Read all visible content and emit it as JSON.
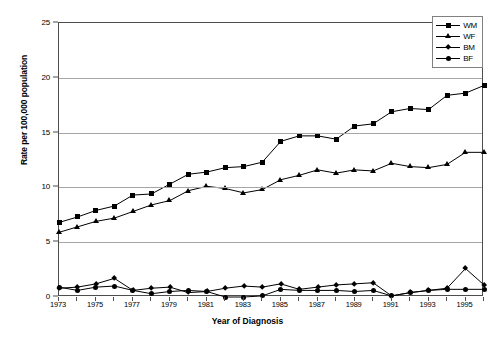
{
  "chart_data": {
    "type": "line",
    "title": "",
    "xlabel": "Year of Diagnosis",
    "ylabel": "Rate per 100,000 population",
    "xlim": [
      1973,
      1996
    ],
    "ylim": [
      0,
      25
    ],
    "ytick_values": [
      0,
      5,
      10,
      15,
      20,
      25
    ],
    "ytick_labels": [
      "0",
      "5",
      "10",
      "15",
      "20",
      "25"
    ],
    "xtick_values": [
      1973,
      1975,
      1977,
      1979,
      1981,
      1983,
      1985,
      1987,
      1989,
      1991,
      1993,
      1995
    ],
    "xtick_labels": [
      "1973",
      "1975",
      "1977",
      "1979",
      "1981",
      "1983",
      "1985",
      "1987",
      "1989",
      "1991",
      "1993",
      "1995"
    ],
    "x": [
      1973,
      1974,
      1975,
      1976,
      1977,
      1978,
      1979,
      1980,
      1981,
      1982,
      1983,
      1984,
      1985,
      1986,
      1987,
      1988,
      1989,
      1990,
      1991,
      1992,
      1993,
      1994,
      1995,
      1996
    ],
    "grid": "horizontal",
    "legend_position": "top-right",
    "series": [
      {
        "name": "WM",
        "marker": "square",
        "values": [
          6.8,
          7.3,
          7.9,
          8.3,
          9.3,
          9.4,
          10.3,
          11.2,
          11.4,
          11.8,
          11.9,
          12.3,
          14.2,
          14.7,
          14.7,
          14.4,
          15.6,
          15.8,
          16.9,
          17.2,
          17.1,
          18.4,
          18.6,
          19.3
        ]
      },
      {
        "name": "WF",
        "marker": "triangle",
        "values": [
          5.9,
          6.4,
          6.9,
          7.2,
          7.8,
          8.4,
          8.8,
          9.7,
          10.1,
          9.9,
          9.5,
          9.8,
          10.7,
          11.1,
          11.6,
          11.3,
          11.6,
          11.5,
          12.2,
          11.9,
          11.8,
          12.1,
          13.2,
          13.2
        ]
      },
      {
        "name": "BM",
        "marker": "diamond",
        "values": [
          0.8,
          0.9,
          1.2,
          1.7,
          0.6,
          0.8,
          0.9,
          0.4,
          0.5,
          0.8,
          1.0,
          0.9,
          1.2,
          0.7,
          0.9,
          1.1,
          1.2,
          1.3,
          0.1,
          0.4,
          0.6,
          0.8,
          2.6,
          1.1
        ]
      },
      {
        "name": "BF",
        "marker": "circle",
        "values": [
          0.9,
          0.6,
          0.9,
          1.0,
          0.6,
          0.3,
          0.5,
          0.6,
          0.5,
          0.0,
          0.0,
          0.1,
          0.7,
          0.6,
          0.6,
          0.6,
          0.5,
          0.6,
          0.1,
          0.4,
          0.6,
          0.7,
          0.7,
          0.7
        ]
      }
    ]
  },
  "legend": {
    "items": [
      {
        "label": "WM"
      },
      {
        "label": "WF"
      },
      {
        "label": "BM"
      },
      {
        "label": "BF"
      }
    ]
  },
  "colors": {
    "series": "#000000",
    "grid": "#a6a6a6",
    "frame": "#4d4d4d",
    "background": "#ffffff"
  }
}
